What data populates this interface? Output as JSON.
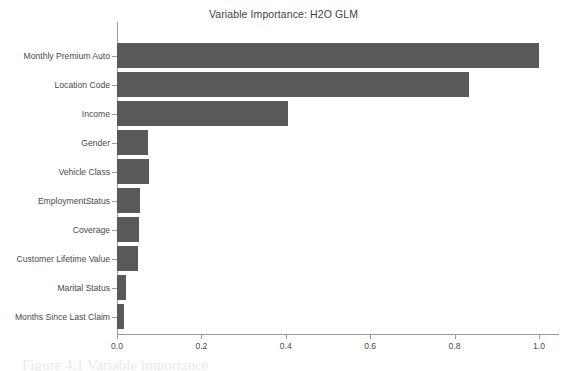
{
  "chart_data": {
    "type": "bar",
    "orientation": "horizontal",
    "title": "Variable Importance: H2O GLM",
    "xlabel": "",
    "ylabel": "",
    "xlim": [
      0.0,
      1.0
    ],
    "grid": false,
    "legend": null,
    "categories": [
      "Monthly Premium Auto",
      "Location Code",
      "Income",
      "Gender",
      "Vehicle Class",
      "EmploymentStatus",
      "Coverage",
      "Customer Lifetime Value",
      "Marital Status",
      "Months Since Last Claim"
    ],
    "values": [
      1.0,
      0.834,
      0.405,
      0.074,
      0.076,
      0.055,
      0.052,
      0.05,
      0.021,
      0.017
    ],
    "xticks": [
      0.0,
      0.2,
      0.4,
      0.6,
      0.8,
      1.0
    ],
    "xtick_labels": [
      "0.0",
      "0.2",
      "0.4",
      "0.6",
      "0.8",
      "1.0"
    ],
    "bar_color": "#595959",
    "axis_color": "#9a9a9a",
    "background_color": "#ffffff",
    "text_color": "#4a4a4a"
  },
  "page": {
    "caption_fragment": "Figure 4.1 Variable importance"
  }
}
